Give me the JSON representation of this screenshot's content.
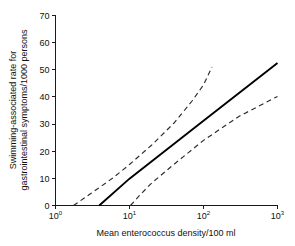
{
  "chart_data": {
    "type": "line",
    "title": "",
    "xlabel": "Mean enterococcus density/100 ml",
    "ylabel_line1": "Swimming-associated rate for",
    "ylabel_line2": "gastrointestinal symptoms/1000 persons",
    "x_scale": "log10",
    "y_scale": "linear",
    "xlim": [
      1,
      1000
    ],
    "ylim": [
      0,
      70
    ],
    "grid": false,
    "legend": null,
    "x_ticks": [
      {
        "value": 1,
        "base": "10",
        "exponent": "0",
        "label": "10^0"
      },
      {
        "value": 10,
        "base": "10",
        "exponent": "1",
        "label": "10^1"
      },
      {
        "value": 100,
        "base": "10",
        "exponent": "2",
        "label": "10^2"
      },
      {
        "value": 1000,
        "base": "10",
        "exponent": "3",
        "label": "10^3"
      }
    ],
    "y_ticks": [
      {
        "value": 0,
        "label": "0"
      },
      {
        "value": 10,
        "label": "10"
      },
      {
        "value": 20,
        "label": "20"
      },
      {
        "value": 30,
        "label": "30"
      },
      {
        "value": 40,
        "label": "40"
      },
      {
        "value": 50,
        "label": "50"
      },
      {
        "value": 60,
        "label": "60"
      },
      {
        "value": 70,
        "label": "70"
      }
    ],
    "series": [
      {
        "name": "fitted-rate",
        "style": "solid",
        "color": "#000000",
        "points": [
          {
            "x": 3.9,
            "y": 0
          },
          {
            "x": 10,
            "y": 9.9
          },
          {
            "x": 100,
            "y": 31.2
          },
          {
            "x": 1000,
            "y": 52.5
          }
        ]
      },
      {
        "name": "upper-confidence-limit",
        "style": "dashed",
        "color": "#2b2b2b",
        "points": [
          {
            "x": 1.75,
            "y": 0
          },
          {
            "x": 3,
            "y": 4.4
          },
          {
            "x": 6,
            "y": 10.2
          },
          {
            "x": 10,
            "y": 15.1
          },
          {
            "x": 20,
            "y": 22.3
          },
          {
            "x": 40,
            "y": 30.4
          },
          {
            "x": 70,
            "y": 38.5
          },
          {
            "x": 100,
            "y": 44.4
          },
          {
            "x": 130,
            "y": 51.0
          }
        ]
      },
      {
        "name": "lower-confidence-limit",
        "style": "dashed",
        "color": "#2b2b2b",
        "points": [
          {
            "x": 10.3,
            "y": 0
          },
          {
            "x": 14,
            "y": 4.0
          },
          {
            "x": 20,
            "y": 8.3
          },
          {
            "x": 40,
            "y": 15.2
          },
          {
            "x": 100,
            "y": 24.0
          },
          {
            "x": 300,
            "y": 32.8
          },
          {
            "x": 1000,
            "y": 40.2
          }
        ]
      }
    ]
  },
  "figure": {
    "background_color": "#ffffff",
    "axis_color": "#1a1a1a"
  }
}
